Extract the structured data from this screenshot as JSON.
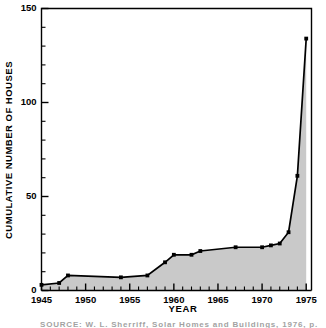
{
  "chart_data": {
    "type": "area",
    "title": "",
    "xlabel": "YEAR",
    "ylabel": "CUMULATIVE NUMBER OF HOUSES",
    "xlim": [
      1945,
      1975.6
    ],
    "ylim": [
      0,
      150
    ],
    "grid": false,
    "legend": null,
    "x_major_ticks": [
      1945,
      1950,
      1955,
      1960,
      1965,
      1970,
      1975
    ],
    "x_major_tick_labels": [
      "1945",
      "1950",
      "1955",
      "1960",
      "1965",
      "1970",
      "1975"
    ],
    "x_minor_tick_step": 1,
    "y_major_ticks": [
      0,
      50,
      100,
      150
    ],
    "y_major_tick_labels": [
      "0",
      "50",
      "100",
      "150"
    ],
    "y_minor_tick_step": 10,
    "fill_color": "#c9c9c9",
    "line_color": "#000000",
    "series": [
      {
        "name": "Cumulative number of houses",
        "x": [
          1945,
          1947,
          1948,
          1954,
          1957,
          1959,
          1960,
          1962,
          1963,
          1967,
          1970,
          1971,
          1972,
          1973,
          1974,
          1975
        ],
        "values": [
          3,
          4,
          8,
          7,
          8,
          15,
          19,
          19,
          21,
          23,
          23,
          24,
          25,
          31,
          61,
          134
        ]
      }
    ]
  },
  "figure": {
    "source_note": "SOURCE:  W. L. Sherriff, Solar Homes and Buildings, 1976, p. 43."
  }
}
